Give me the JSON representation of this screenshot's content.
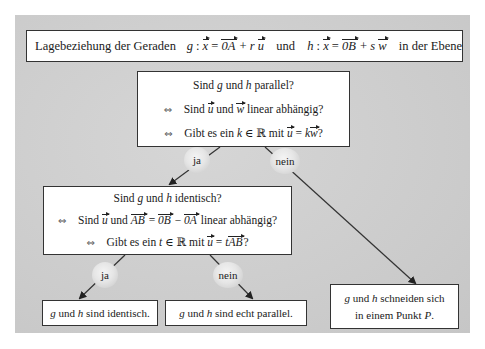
{
  "title": {
    "prefix": "Lagebeziehung der Geraden",
    "g_name": "g",
    "colon": ":",
    "x": "x",
    "eq": "=",
    "OA": "0A",
    "plus": "+",
    "r": "r",
    "u": "u",
    "und": "und",
    "h_name": "h",
    "OB": "0B",
    "s": "s",
    "w": "w",
    "suffix": "in der Ebene"
  },
  "top_question": {
    "line1_a": "Sind",
    "line1_g": "g",
    "line1_b": "und",
    "line1_h": "h",
    "line1_c": "parallel?",
    "equiv": "⇔",
    "line2_a": "Sind",
    "line2_u": "u",
    "line2_b": "und",
    "line2_w": "w",
    "line2_c": "linear abhängig?",
    "line3_a": "Gibt es ein",
    "line3_k": "k",
    "line3_in": "∈ ℝ mit",
    "line3_u": "u",
    "line3_eq": "=",
    "line3_k2": "k",
    "line3_w": "w",
    "line3_q": "?"
  },
  "branch_top": {
    "yes": "ja",
    "no": "nein"
  },
  "middle_question": {
    "line1_a": "Sind",
    "line1_g": "g",
    "line1_b": "und",
    "line1_h": "h",
    "line1_c": "identisch?",
    "equiv": "⇔",
    "line2_a": "Sind",
    "line2_u": "u",
    "line2_b": "und",
    "line2_AB": "AB",
    "line2_eq": "=",
    "line2_OB": "0B",
    "line2_minus": "−",
    "line2_OA": "0A",
    "line2_c": "linear abhängig?",
    "line3_a": "Gibt es ein",
    "line3_t": "t",
    "line3_in": "∈ ℝ mit",
    "line3_u": "u",
    "line3_eq": "=",
    "line3_t2": "t",
    "line3_AB": "AB",
    "line3_q": "?"
  },
  "branch_middle": {
    "yes": "ja",
    "no": "nein"
  },
  "results": {
    "identical": {
      "g": "g",
      "und": "und",
      "h": "h",
      "text": "sind identisch."
    },
    "parallel": {
      "g": "g",
      "und": "und",
      "h": "h",
      "text": "sind echt parallel."
    },
    "intersect": {
      "g": "g",
      "und": "und",
      "h": "h",
      "text1": "schneiden sich",
      "text2": "in einem Punkt",
      "P": "P",
      "dot": "."
    }
  },
  "colors": {
    "panel": "#cfcfcf",
    "box_fill": "#ffffff",
    "border": "#333333",
    "arrow": "#222222"
  }
}
